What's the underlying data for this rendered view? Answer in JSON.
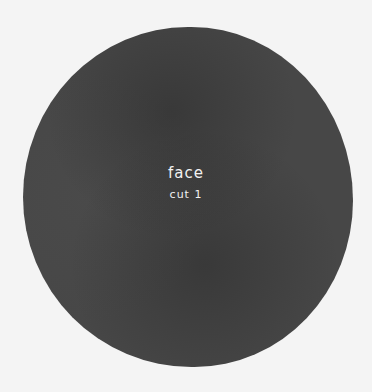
{
  "disc": {
    "color": "#474747",
    "background": "#f4f4f4"
  },
  "label": {
    "title": "face",
    "subtitle": "cut 1"
  }
}
